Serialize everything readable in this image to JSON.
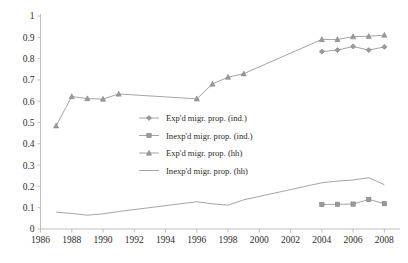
{
  "chart_data": {
    "type": "line",
    "title": "",
    "xlabel": "",
    "ylabel": "",
    "xlim": [
      1986,
      2009
    ],
    "ylim": [
      0,
      1
    ],
    "grid": false,
    "legend_position": "center",
    "ytick_labels": [
      "1",
      "0.9",
      "0.8",
      "0.7",
      "0.6",
      "0.5",
      "0.4",
      "0.3",
      "0.2",
      "0.1",
      "0"
    ],
    "ytick_values": [
      1,
      0.9,
      0.8,
      0.7,
      0.6,
      0.5,
      0.4,
      0.3,
      0.2,
      0.1,
      0
    ],
    "xtick_labels": [
      "1986",
      "1988",
      "1990",
      "1992",
      "1994",
      "1996",
      "1998",
      "2000",
      "2002",
      "2004",
      "2006",
      "2008"
    ],
    "xtick_values": [
      1986,
      1988,
      1990,
      1992,
      1994,
      1996,
      1998,
      2000,
      2002,
      2004,
      2006,
      2008
    ],
    "series": [
      {
        "name": "Exp'd migr. prop. (ind.)",
        "marker": "diamond",
        "color": "#9a9a9a",
        "x": [
          2004,
          2005,
          2006,
          2007,
          2008
        ],
        "values": [
          0.833,
          0.84,
          0.857,
          0.84,
          0.855
        ]
      },
      {
        "name": "Inexp'd migr. prop. (ind.)",
        "marker": "square",
        "color": "#9a9a9a",
        "x": [
          2004,
          2005,
          2006,
          2007,
          2008
        ],
        "values": [
          0.115,
          0.116,
          0.117,
          0.139,
          0.119
        ]
      },
      {
        "name": "Exp'd migr. prop. (hh)",
        "marker": "triangle",
        "color": "#9a9a9a",
        "x": [
          1987,
          1988,
          1989,
          1990,
          1991,
          1996,
          1997,
          1998,
          1999,
          2004,
          2005,
          2006,
          2007,
          2008
        ],
        "values": [
          0.485,
          0.622,
          0.612,
          0.61,
          0.634,
          0.611,
          0.681,
          0.713,
          0.729,
          0.89,
          0.89,
          0.903,
          0.905,
          0.91
        ]
      },
      {
        "name": "Inexp'd migr. prop. (hh)",
        "marker": "none",
        "color": "#b0b0b0",
        "x": [
          1987,
          1988,
          1989,
          1990,
          1991,
          1996,
          1997,
          1998,
          1999,
          2004,
          2005,
          2006,
          2007,
          2008
        ],
        "values": [
          0.079,
          0.073,
          0.065,
          0.071,
          0.082,
          0.128,
          0.118,
          0.112,
          0.137,
          0.217,
          0.225,
          0.23,
          0.241,
          0.208
        ]
      }
    ]
  },
  "legend": {
    "items": [
      {
        "label": "Exp'd migr. prop. (ind.)",
        "marker": "diamond"
      },
      {
        "label": "Inexp'd migr. prop. (ind.)",
        "marker": "square"
      },
      {
        "label": "Exp'd migr. prop. (hh)",
        "marker": "triangle"
      },
      {
        "label": "Inexp'd migr. prop. (hh)",
        "marker": "none"
      }
    ]
  },
  "colors": {
    "line": "#9a9a9a",
    "axis": "#b9b9b9",
    "text": "#2b2b2b",
    "background": "#ffffff"
  }
}
